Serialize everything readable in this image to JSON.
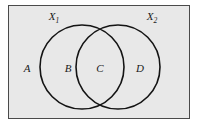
{
  "figure": {
    "name": "venn-diagram-two-sets",
    "background_color": "#ffffff",
    "panel_color": "#e8e8e8",
    "border_color": "#4a4a4a",
    "stroke_color": "#141414"
  },
  "chart_data": {
    "type": "diagram",
    "diagram_kind": "venn",
    "title": "",
    "sets": [
      {
        "id": "X1",
        "label_text": "X",
        "label_sub": "1",
        "label_x": 54,
        "label_y": 20,
        "cx": 82,
        "cy": 67,
        "r": 42
      },
      {
        "id": "X2",
        "label_text": "X",
        "label_sub": "2",
        "label_x": 152,
        "label_y": 20,
        "cx": 118,
        "cy": 67,
        "r": 42
      }
    ],
    "regions": [
      {
        "id": "A",
        "label": "A",
        "meaning": "outside-both",
        "x": 27,
        "y": 72
      },
      {
        "id": "B",
        "label": "B",
        "meaning": "X1-only",
        "x": 68,
        "y": 72
      },
      {
        "id": "C",
        "label": "C",
        "meaning": "X1-and-X2-intersection",
        "x": 100,
        "y": 72
      },
      {
        "id": "D",
        "label": "D",
        "meaning": "X2-only",
        "x": 140,
        "y": 72
      }
    ],
    "panel": {
      "x": 8.5,
      "y": 5.5,
      "width": 181,
      "height": 113
    }
  }
}
